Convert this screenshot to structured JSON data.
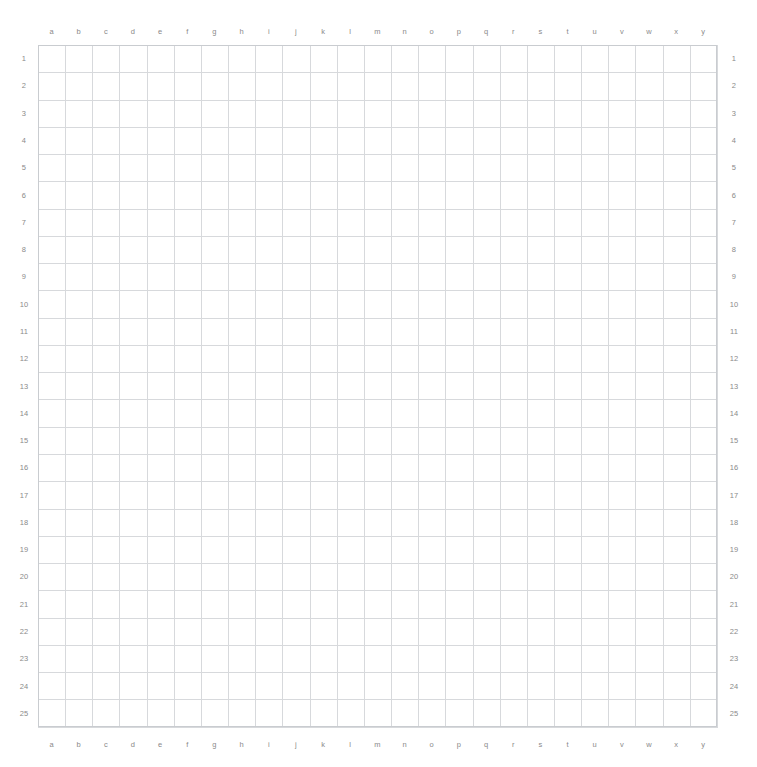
{
  "sheet": {
    "title": "coordinate-grid",
    "columns": [
      "a",
      "b",
      "c",
      "d",
      "e",
      "f",
      "g",
      "h",
      "i",
      "j",
      "k",
      "l",
      "m",
      "n",
      "o",
      "p",
      "q",
      "r",
      "s",
      "t",
      "u",
      "v",
      "w",
      "x",
      "y"
    ],
    "rows": [
      "1",
      "2",
      "3",
      "4",
      "5",
      "6",
      "7",
      "8",
      "9",
      "10",
      "11",
      "12",
      "13",
      "14",
      "15",
      "16",
      "17",
      "18",
      "19",
      "20",
      "21",
      "22",
      "23",
      "24",
      "25"
    ],
    "column_count": 25,
    "row_count": 25,
    "cell_values": [],
    "colors": {
      "background": "#ffffff",
      "grid_line": "#d7d9dc",
      "grid_border": "#c9ccd0",
      "label_text": "#8a8a8a"
    }
  }
}
